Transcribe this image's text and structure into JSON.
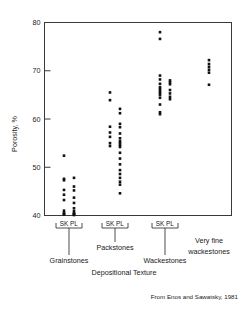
{
  "figure": {
    "title": "",
    "credit": "From Enos and Sawatsky, 1981"
  },
  "axes": {
    "ylabel": "Porosity, %",
    "xlabel": "Depositional Texture",
    "yticks": [
      "40",
      "50",
      "60",
      "70",
      "80"
    ],
    "ylim": [
      40,
      80
    ]
  },
  "groups": [
    {
      "name": "Grainstones",
      "sub_label": "SK  PL",
      "sub_sk": "SK",
      "sub_pl": "PL"
    },
    {
      "name": "Packstones",
      "sub_label": "SK  PL",
      "sub_sk": "SK",
      "sub_pl": "PL"
    },
    {
      "name": "Wackestones",
      "sub_label": "SK  PL",
      "sub_sk": "SK",
      "sub_pl": "PL"
    },
    {
      "name_line1": "Very fine",
      "name_line2": "wackestones",
      "name": "Very fine wackestones"
    }
  ],
  "chart_data": {
    "type": "scatter",
    "title": "",
    "xlabel": "Depositional Texture",
    "ylabel": "Porosity, %",
    "ylim": [
      40,
      80
    ],
    "yticks": [
      40,
      50,
      60,
      70,
      80
    ],
    "grid": false,
    "legend": "none",
    "annotation": "From Enos and Sawatsky, 1981",
    "series": [
      {
        "name": "Grainstones SK",
        "group": "Grainstones",
        "subgroup": "SK",
        "x_category": 0,
        "values": [
          52.4,
          47.6,
          47.3,
          45.3,
          44.3,
          43.2,
          41.0,
          40.5,
          40.3,
          40.2
        ]
      },
      {
        "name": "Grainstones PL",
        "group": "Grainstones",
        "subgroup": "PL",
        "x_category": 1,
        "values": [
          47.8,
          46.0,
          45.2,
          43.7,
          42.6,
          41.5,
          40.9,
          40.5,
          40.3,
          40.2,
          40.1
        ]
      },
      {
        "name": "Packstones SK",
        "group": "Packstones",
        "subgroup": "SK",
        "x_category": 2,
        "values": [
          65.5,
          63.9,
          58.4,
          57.2,
          56.3,
          55.0,
          54.4
        ]
      },
      {
        "name": "Packstones PL",
        "group": "Packstones",
        "subgroup": "PL",
        "x_category": 3,
        "values": [
          62.1,
          61.2,
          59.0,
          58.3,
          57.0,
          56.0,
          55.4,
          55.0,
          54.6,
          54.2,
          53.0,
          51.8,
          50.6,
          49.4,
          48.6,
          47.8,
          47.0,
          46.4,
          44.6
        ]
      },
      {
        "name": "Wackestones SK",
        "group": "Wackestones",
        "subgroup": "SK",
        "x_category": 4,
        "values": [
          78.0,
          76.6,
          69.0,
          68.2,
          67.3,
          66.6,
          66.2,
          65.8,
          65.4,
          65.0,
          64.4,
          63.0,
          61.4,
          61.0
        ]
      },
      {
        "name": "Wackestones PL",
        "group": "Wackestones",
        "subgroup": "PL",
        "x_category": 5,
        "values": [
          68.0,
          67.6,
          67.2,
          66.0,
          65.3,
          64.6,
          64.1
        ]
      },
      {
        "name": "Very fine wackestones",
        "group": "Very fine wackestones",
        "subgroup": "",
        "x_category": 6,
        "values": [
          72.2,
          71.4,
          70.8,
          70.2,
          69.6,
          67.1
        ]
      }
    ]
  }
}
